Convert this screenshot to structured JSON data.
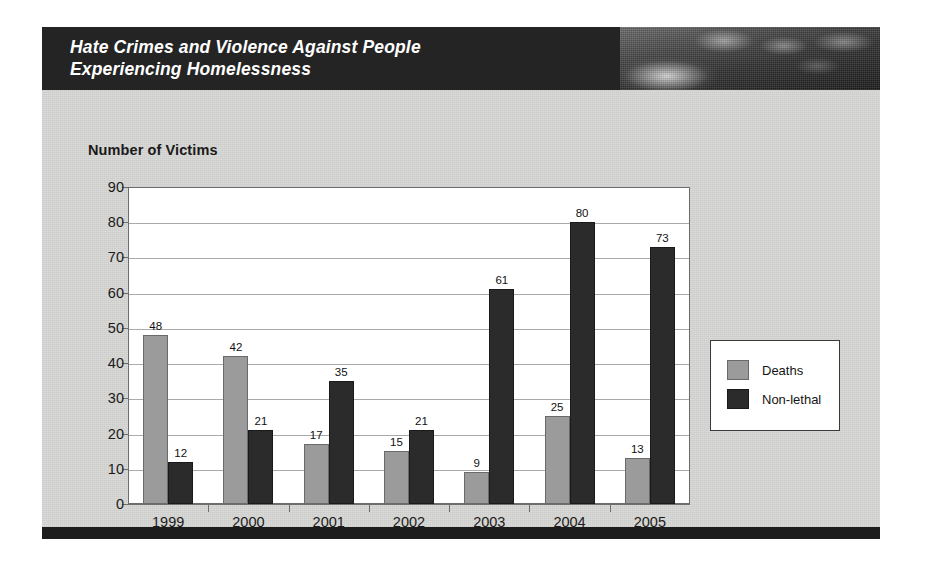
{
  "card": {
    "header": {
      "title": "Hate Crimes and Violence Against People\nExperiencing Homelessness",
      "photo_alt": "homelessness-photo-strip"
    }
  },
  "chart_data": {
    "type": "bar",
    "title": "Hate Crimes and Violence Against People Experiencing Homelessness",
    "axis_title": "Number of Victims",
    "xlabel": "",
    "ylabel": "Number of Victims",
    "ylim": [
      0,
      90
    ],
    "ytick_step": 10,
    "yticks": [
      "0",
      "10",
      "20",
      "30",
      "40",
      "50",
      "60",
      "70",
      "80",
      "90"
    ],
    "grid": true,
    "legend_position": "right",
    "categories": [
      "1999",
      "2000",
      "2001",
      "2002",
      "2003",
      "2004",
      "2005"
    ],
    "series": [
      {
        "name": "Deaths",
        "color": "#9b9b9b",
        "values": [
          48,
          42,
          17,
          15,
          9,
          25,
          13
        ],
        "labels": [
          "48",
          "42",
          "17",
          "15",
          "9",
          "25",
          "13"
        ]
      },
      {
        "name": "Non-lethal",
        "color": "#2b2b2b",
        "values": [
          12,
          21,
          35,
          21,
          61,
          80,
          73
        ],
        "labels": [
          "12",
          "21",
          "35",
          "21",
          "61",
          "80",
          "73"
        ]
      }
    ]
  },
  "legend": {
    "items": [
      {
        "label": "Deaths",
        "swatch": "deaths-swatch"
      },
      {
        "label": "Non-lethal",
        "swatch": "nonlethal-swatch"
      }
    ]
  },
  "colors": {
    "header_bar": "#242424",
    "card_bg": "#d8d8d6",
    "footer_band": "#1c1c1c",
    "plot_bg": "#ffffff",
    "gridline": "#a9a9a9",
    "deaths": "#9b9b9b",
    "nonlethal": "#2b2b2b"
  }
}
